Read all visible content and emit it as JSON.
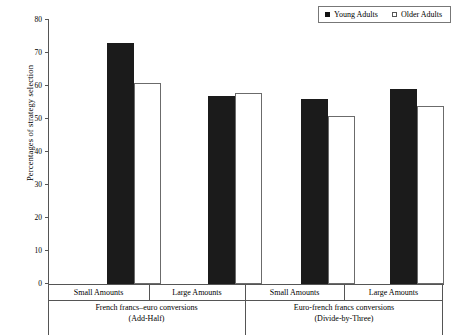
{
  "chart_data": {
    "type": "bar",
    "title": "",
    "xlabel": "",
    "ylabel": "Percentages of strategy selection",
    "ylim": [
      0,
      80
    ],
    "ytick_step": 10,
    "yticks": [
      "80",
      "70",
      "60",
      "50",
      "40",
      "30",
      "20",
      "10",
      "0"
    ],
    "grid": false,
    "legend_position": "top-right",
    "categories": [
      "Small Amounts",
      "Large Amounts",
      "Small Amounts",
      "Large Amounts"
    ],
    "groups": [
      {
        "line1": "French francs–euro conversions",
        "line2": "(Add-Half)",
        "categories": [
          "Small Amounts",
          "Large Amounts"
        ]
      },
      {
        "line1": "Euro-french francs conversions",
        "line2": "(Divide-by-Three)",
        "categories": [
          "Small Amounts",
          "Large Amounts"
        ]
      }
    ],
    "series": [
      {
        "name": "Young Adults",
        "color": "#1b1b1b",
        "values": [
          73,
          57,
          56,
          59
        ]
      },
      {
        "name": "Older Adults",
        "color": "#ffffff",
        "values": [
          61,
          58,
          51,
          54
        ]
      }
    ]
  },
  "legend": {
    "entries": [
      {
        "label": "Young Adults",
        "swatch": "filled-square-icon"
      },
      {
        "label": "Older Adults",
        "swatch": "open-square-icon"
      }
    ]
  },
  "axis": {
    "y_title": "Percentages of strategy selection"
  }
}
